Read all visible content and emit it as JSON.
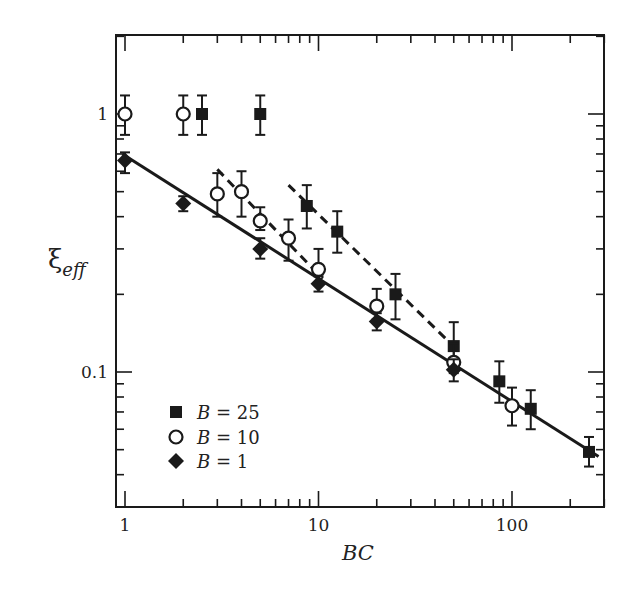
{
  "chart_data": {
    "type": "scatter",
    "title": "",
    "xlabel": "BC",
    "ylabel": "ξ_eff",
    "ylabel_main": "ξ",
    "ylabel_sub": "eff",
    "xscale": "log",
    "yscale": "log",
    "xlim": [
      0.9,
      300
    ],
    "ylim": [
      0.03,
      2.0
    ],
    "grid": false,
    "x_ticks": [
      {
        "value": 1,
        "label": "1"
      },
      {
        "value": 10,
        "label": "10"
      },
      {
        "value": 100,
        "label": "100"
      }
    ],
    "y_ticks": [
      {
        "value": 0.1,
        "label": "0.1"
      },
      {
        "value": 1,
        "label": "1"
      }
    ],
    "legend_position": "lower left",
    "series": [
      {
        "name": "B = 25",
        "label_var": "B",
        "label_eq": "= 25",
        "marker": "filled-square",
        "points": [
          {
            "x": 2.5,
            "y": 1.0,
            "err_lo": 0.17,
            "err_hi": 0.18
          },
          {
            "x": 5,
            "y": 1.0,
            "err_lo": 0.17,
            "err_hi": 0.18
          },
          {
            "x": 8.7,
            "y": 0.44,
            "err_lo": 0.08,
            "err_hi": 0.09
          },
          {
            "x": 12.5,
            "y": 0.35,
            "err_lo": 0.06,
            "err_hi": 0.07
          },
          {
            "x": 25,
            "y": 0.2,
            "err_lo": 0.04,
            "err_hi": 0.04
          },
          {
            "x": 50,
            "y": 0.126,
            "err_lo": 0.025,
            "err_hi": 0.03
          },
          {
            "x": 86,
            "y": 0.092,
            "err_lo": 0.016,
            "err_hi": 0.018
          },
          {
            "x": 125,
            "y": 0.072,
            "err_lo": 0.012,
            "err_hi": 0.013
          },
          {
            "x": 250,
            "y": 0.049,
            "err_lo": 0.006,
            "err_hi": 0.007
          }
        ]
      },
      {
        "name": "B = 10",
        "label_var": "B",
        "label_eq": "= 10",
        "marker": "open-circle",
        "points": [
          {
            "x": 1,
            "y": 1.0,
            "err_lo": 0.17,
            "err_hi": 0.18
          },
          {
            "x": 2,
            "y": 1.0,
            "err_lo": 0.17,
            "err_hi": 0.18
          },
          {
            "x": 3,
            "y": 0.49,
            "err_lo": 0.09,
            "err_hi": 0.1
          },
          {
            "x": 4,
            "y": 0.5,
            "err_lo": 0.1,
            "err_hi": 0.1
          },
          {
            "x": 5,
            "y": 0.385,
            "err_lo": 0.03,
            "err_hi": 0.05
          },
          {
            "x": 7,
            "y": 0.33,
            "err_lo": 0.06,
            "err_hi": 0.06
          },
          {
            "x": 10,
            "y": 0.25,
            "err_lo": 0.03,
            "err_hi": 0.05
          },
          {
            "x": 20,
            "y": 0.18,
            "err_lo": 0.02,
            "err_hi": 0.03
          },
          {
            "x": 50,
            "y": 0.109,
            "err_lo": 0.01,
            "err_hi": 0.02
          },
          {
            "x": 100,
            "y": 0.074,
            "err_lo": 0.012,
            "err_hi": 0.013
          }
        ]
      },
      {
        "name": "B = 1",
        "label_var": "B",
        "label_eq": "= 1",
        "marker": "filled-diamond",
        "points": [
          {
            "x": 1,
            "y": 0.66,
            "err_lo": 0.07,
            "err_hi": 0.05
          },
          {
            "x": 2,
            "y": 0.45,
            "err_lo": 0.03,
            "err_hi": 0.03
          },
          {
            "x": 5,
            "y": 0.3,
            "err_lo": 0.025,
            "err_hi": 0.03
          },
          {
            "x": 10,
            "y": 0.22,
            "err_lo": 0.015,
            "err_hi": 0.015
          },
          {
            "x": 20,
            "y": 0.157,
            "err_lo": 0.012,
            "err_hi": 0.012
          },
          {
            "x": 50,
            "y": 0.102,
            "err_lo": 0.01,
            "err_hi": 0.01
          }
        ]
      }
    ],
    "fit_lines": [
      {
        "name": "fit-B1",
        "style": "solid",
        "x": [
          0.97,
          280
        ],
        "y": [
          0.7,
          0.047
        ]
      },
      {
        "name": "fit-B10",
        "style": "dashed",
        "x": [
          3,
          10.5
        ],
        "y": [
          0.61,
          0.23
        ]
      },
      {
        "name": "fit-B25",
        "style": "dashed",
        "x": [
          7,
          52
        ],
        "y": [
          0.53,
          0.122
        ]
      }
    ]
  }
}
